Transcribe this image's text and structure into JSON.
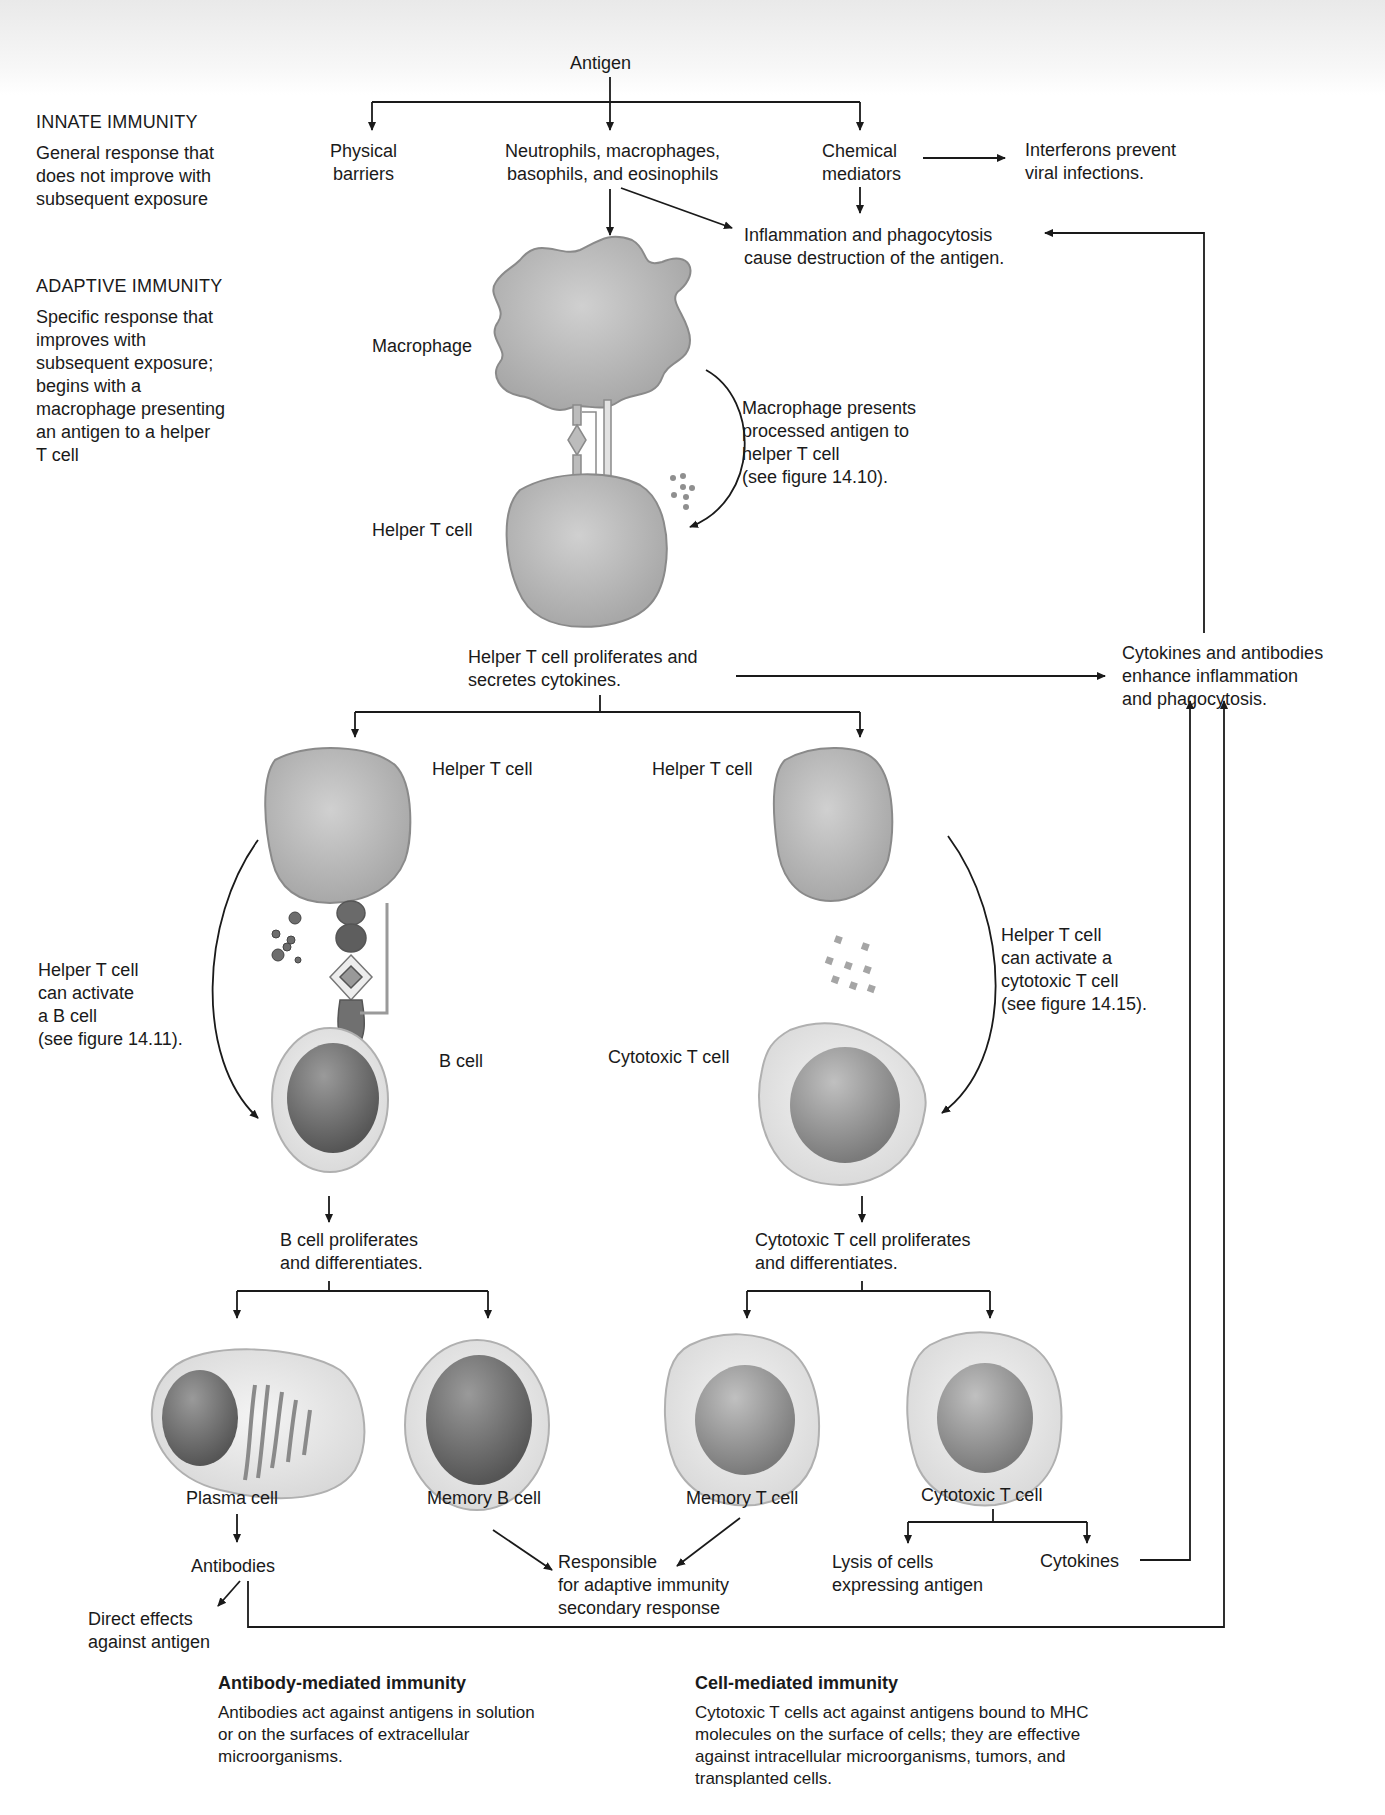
{
  "diagram": {
    "root": "Antigen",
    "innate": {
      "heading": "INNATE IMMUNITY",
      "description": "General response that\ndoes not improve with\nsubsequent exposure",
      "branches": {
        "physical": "Physical\nbarriers",
        "cells": "Neutrophils, macrophages,\nbasophils, and eosinophils",
        "chemical": "Chemical\nmediators"
      },
      "interferons": "Interferons prevent\nviral infections.",
      "inflammation": "Inflammation and phagocytosis\ncause destruction of the antigen."
    },
    "adaptive": {
      "heading": "ADAPTIVE IMMUNITY",
      "description": "Specific response that\nimproves with\nsubsequent exposure;\nbegins with a\nmacrophage presenting\nan antigen to a helper\nT cell",
      "macrophage_label": "Macrophage",
      "helper_t_label": "Helper T cell",
      "presentation_note": "Macrophage presents\nprocessed antigen to\nhelper T cell\n(see figure 14.10).",
      "helper_proliferates": "Helper T cell proliferates and\nsecretes cytokines.",
      "enhance": "Cytokines and antibodies\nenhance inflammation\nand phagocytosis.",
      "b_branch": {
        "helper_t_label": "Helper T cell",
        "activation_note": "Helper T cell\ncan activate\na B cell\n(see figure 14.11).",
        "b_cell_label": "B cell",
        "proliferates": "B cell proliferates\nand differentiates.",
        "plasma_cell": "Plasma cell",
        "memory_b_cell": "Memory B cell",
        "antibodies": "Antibodies",
        "direct_effects": "Direct effects\nagainst antigen"
      },
      "t_branch": {
        "helper_t_label": "Helper T cell",
        "activation_note": "Helper T cell\ncan activate a\ncytotoxic T cell\n(see figure 14.15).",
        "cytotoxic_label": "Cytotoxic T cell",
        "proliferates": "Cytotoxic T cell proliferates\nand differentiates.",
        "memory_t_cell": "Memory T cell",
        "cytotoxic_t_cell": "Cytotoxic T cell",
        "lysis": "Lysis of cells\nexpressing antigen",
        "cytokines": "Cytokines"
      },
      "secondary_response": "Responsible\nfor adaptive immunity\nsecondary response"
    },
    "footer": {
      "antibody_mediated": {
        "title": "Antibody-mediated immunity",
        "text": "Antibodies act against antigens in solution\nor on the surfaces of extracellular\nmicroorganisms."
      },
      "cell_mediated": {
        "title": "Cell-mediated immunity",
        "text": "Cytotoxic T cells act against antigens bound to MHC\nmolecules on the surface of cells; they are effective\nagainst intracellular microorganisms, tumors, and\ntransplanted cells."
      }
    },
    "colors": {
      "line": "#1a1a1a",
      "cell_fill": "#bdbdbd",
      "cell_edge": "#8a8a8a",
      "nucleus": "#6e6e6e",
      "cytoplasm": "#ececec"
    }
  }
}
